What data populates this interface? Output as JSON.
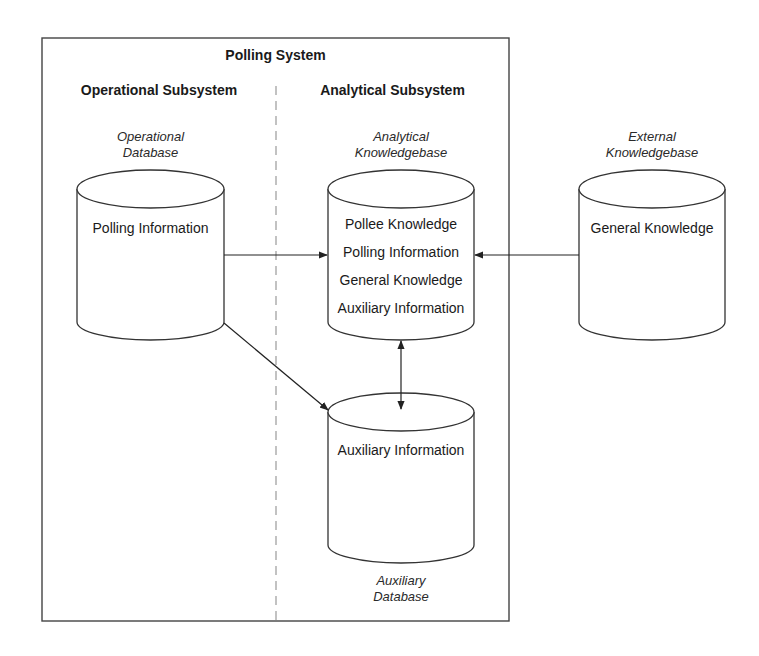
{
  "diagram": {
    "system_title": "Polling System",
    "operational": {
      "title": "Operational Subsystem",
      "db_caption_line1": "Operational",
      "db_caption_line2": "Database",
      "db_items": [
        "Polling Information"
      ]
    },
    "analytical": {
      "title": "Analytical Subsystem",
      "kb_caption_line1": "Analytical",
      "kb_caption_line2": "Knowledgebase",
      "kb_items": [
        "Pollee Knowledge",
        "Polling Information",
        "General Knowledge",
        "Auxiliary Information"
      ],
      "aux_caption_line1": "Auxiliary",
      "aux_caption_line2": "Database",
      "aux_items": [
        "Auxiliary Information"
      ]
    },
    "external": {
      "caption_line1": "External",
      "caption_line2": "Knowledgebase",
      "items": [
        "General Knowledge"
      ]
    },
    "edges": [
      {
        "from": "Operational Database",
        "to": "Analytical Knowledgebase",
        "type": "arrow"
      },
      {
        "from": "External Knowledgebase",
        "to": "Analytical Knowledgebase",
        "type": "arrow"
      },
      {
        "from": "Operational Database",
        "to": "Auxiliary Database",
        "type": "arrow"
      },
      {
        "from": "Analytical Knowledgebase",
        "to": "Auxiliary Database",
        "type": "bidirectional"
      }
    ],
    "colors": {
      "stroke": "#333333",
      "divider": "#9a9a9a",
      "background": "#ffffff"
    }
  }
}
